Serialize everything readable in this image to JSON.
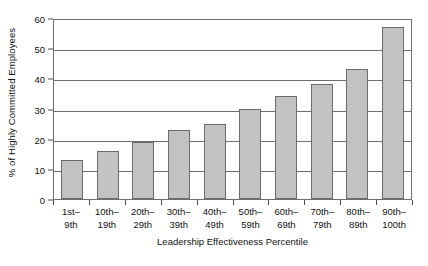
{
  "chart_data": {
    "type": "bar",
    "title": "",
    "xlabel": "Leadership Effectiveness Percentile",
    "ylabel": "% of Highly Committed Employees",
    "categories": [
      "1st–9th",
      "10th–19th",
      "20th–29th",
      "30th–39th",
      "40th–49th",
      "50th–59th",
      "60th–69th",
      "70th–79th",
      "80th–89th",
      "90th–100th"
    ],
    "category_lines": [
      {
        "line1": "1st–",
        "line2": "9th"
      },
      {
        "line1": "10th–",
        "line2": "19th"
      },
      {
        "line1": "20th–",
        "line2": "29th"
      },
      {
        "line1": "30th–",
        "line2": "39th"
      },
      {
        "line1": "40th–",
        "line2": "49th"
      },
      {
        "line1": "50th–",
        "line2": "59th"
      },
      {
        "line1": "60th–",
        "line2": "69th"
      },
      {
        "line1": "70th–",
        "line2": "79th"
      },
      {
        "line1": "80th–",
        "line2": "89th"
      },
      {
        "line1": "90th–",
        "line2": "100th"
      }
    ],
    "values": [
      13,
      16,
      19,
      23,
      25,
      30,
      34,
      38,
      43,
      57
    ],
    "ylim": [
      0,
      60
    ],
    "yticks": [
      0,
      10,
      20,
      30,
      40,
      50,
      60
    ],
    "ytick_labels": [
      "0",
      "10",
      "20",
      "30",
      "40",
      "50",
      "60"
    ],
    "grid": true,
    "grid_axis": "y",
    "legend": "none",
    "bar_color": "#c2c2c2",
    "bar_border_color": "#6b6b6b",
    "axis_color": "#6e6e6e"
  }
}
